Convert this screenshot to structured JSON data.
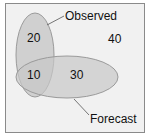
{
  "diagram": {
    "type": "venn",
    "sets": [
      {
        "name": "Observed",
        "label": "Observed"
      },
      {
        "name": "Forecast",
        "label": "Forecast"
      }
    ],
    "regions": {
      "observed_only": "20",
      "both": "10",
      "forecast_only": "30",
      "neither": "40"
    },
    "colors": {
      "background": "#f1f1f1",
      "ellipse_fill": "#c8c8c8",
      "ellipse_stroke": "#9a9a9a",
      "border": "#8a8a8a"
    }
  }
}
